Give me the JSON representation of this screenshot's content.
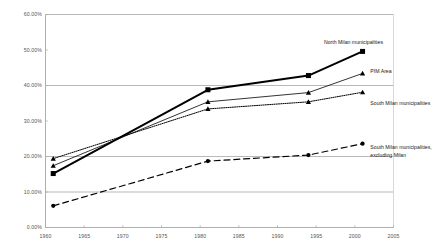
{
  "chart_data": {
    "type": "line",
    "title": "",
    "xlabel": "",
    "ylabel": "",
    "xlim": [
      1960,
      2005
    ],
    "ylim": [
      0,
      60
    ],
    "grid": "horizontal",
    "gridlines_y": [
      10,
      20,
      40,
      60
    ],
    "legend_position": "inline-right-of-last-point",
    "x_ticks": [
      "1960",
      "1965",
      "1970",
      "1975",
      "1980",
      "1985",
      "1990",
      "1995",
      "2000",
      "2005"
    ],
    "x_tick_values": [
      1960,
      1965,
      1970,
      1975,
      1980,
      1985,
      1990,
      1995,
      2000,
      2005
    ],
    "y_ticks": [
      "0.00%",
      "10.00%",
      "20.00%",
      "30.00%",
      "40.00%",
      "50.00%",
      "60.00%"
    ],
    "y_tick_values": [
      0,
      10,
      20,
      30,
      40,
      50,
      60
    ],
    "x": [
      1961,
      1981,
      1994,
      2001
    ],
    "series": [
      {
        "name": "North Milan municipalities",
        "values": [
          15.2,
          38.8,
          42.8,
          49.6
        ],
        "marker": "square",
        "line_style": "solid",
        "line_width": 2.0,
        "color": "#000000"
      },
      {
        "name": "PIM Area",
        "values": [
          17.4,
          35.4,
          38.0,
          43.4
        ],
        "marker": "triangle",
        "line_style": "solid",
        "line_width": 0.8,
        "color": "#000000"
      },
      {
        "name": "South Milan municipalities",
        "values": [
          19.4,
          33.4,
          35.4,
          38.1
        ],
        "marker": "triangle",
        "line_style": "dotted",
        "line_width": 1.0,
        "color": "#000000"
      },
      {
        "name": "South Milan municipalities, excluding Milan",
        "values": [
          6.1,
          18.7,
          20.4,
          23.6
        ],
        "marker": "circle",
        "line_style": "dashed",
        "line_width": 1.2,
        "color": "#000000"
      }
    ],
    "annotations": [
      {
        "text": "North Milan municipalities",
        "x": 1996,
        "y": 52.0
      },
      {
        "text": "PIM Area",
        "x": 2002,
        "y": 44.0
      },
      {
        "text": "South Milan municipalities",
        "x": 2002,
        "y": 35.0
      },
      {
        "text": "South Milan municipalities,",
        "x": 2002,
        "y": 22.5
      },
      {
        "text": "excluding Milan",
        "x": 2002,
        "y": 20.3
      }
    ]
  }
}
